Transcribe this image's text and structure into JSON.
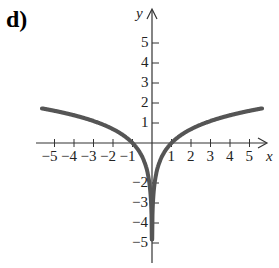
{
  "panel_label": "d)",
  "chart_data": {
    "type": "line",
    "title": "",
    "function": "y = ln|x|",
    "xlabel": "x",
    "ylabel": "y",
    "xlim": [
      -5.5,
      5.5
    ],
    "ylim": [
      -5.5,
      5.5
    ],
    "x_ticks": [
      -5,
      -4,
      -3,
      -2,
      -1,
      1,
      2,
      3,
      4,
      5
    ],
    "y_ticks": [
      -5,
      -4,
      -3,
      -2,
      1,
      2,
      3,
      4,
      5
    ],
    "x_tick_labels": [
      "−5",
      "−4",
      "−3",
      "−2",
      "−1",
      "1",
      "2",
      "3",
      "4",
      "5"
    ],
    "y_tick_labels": [
      "−5",
      "−4",
      "−3",
      "−2",
      "1",
      "2",
      "3",
      "4",
      "5"
    ],
    "series": [
      {
        "name": "left branch",
        "x": [
          -5.5,
          -4,
          -3,
          -2,
          -1,
          -0.5,
          -0.2,
          -0.05
        ],
        "y": [
          1.7,
          1.39,
          1.1,
          0.69,
          0,
          -0.69,
          -1.61,
          -3.0
        ]
      },
      {
        "name": "right branch",
        "x": [
          0.05,
          0.2,
          0.5,
          1,
          2,
          3,
          4,
          5.5
        ],
        "y": [
          -3.0,
          -1.61,
          -0.69,
          0,
          0.69,
          1.1,
          1.39,
          1.7
        ]
      }
    ],
    "asymptote": {
      "x": 0,
      "style": "vertical"
    },
    "grid": false,
    "curve_color": "#555555"
  }
}
